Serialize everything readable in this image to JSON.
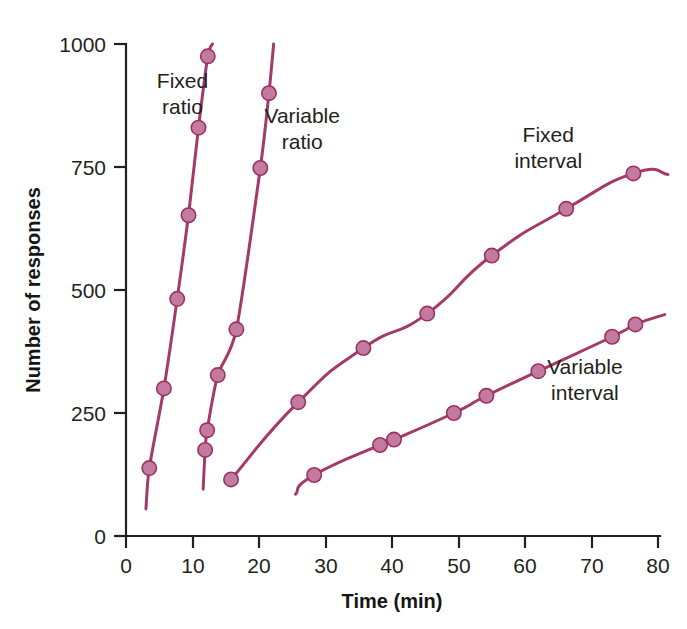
{
  "chart_data": {
    "type": "line",
    "title": "",
    "xlabel": "Time (min)",
    "ylabel": "Number of responses",
    "xlim": [
      0,
      83
    ],
    "ylim": [
      0,
      1010
    ],
    "xticks": [
      0,
      10,
      20,
      30,
      40,
      50,
      60,
      70,
      80
    ],
    "yticks": [
      0,
      250,
      500,
      750,
      1000
    ],
    "grid": false,
    "legend_position": "inline-annotations",
    "colors": {
      "line": "#A33A68",
      "marker_fill": "#C27A9E",
      "marker_stroke": "#9E3163",
      "axis": "#231f20",
      "background": "#FFFFFF"
    },
    "series": [
      {
        "name": "Fixed ratio",
        "label": "Fixed ratio",
        "label_line1": "Fixed",
        "label_line2": "ratio",
        "points": [
          {
            "x": 3.5,
            "y": 138
          },
          {
            "x": 5.7,
            "y": 300
          },
          {
            "x": 7.7,
            "y": 482
          },
          {
            "x": 9.4,
            "y": 652
          },
          {
            "x": 10.9,
            "y": 830
          },
          {
            "x": 12.3,
            "y": 975
          }
        ],
        "start": {
          "x": 3.0,
          "y": 55
        },
        "end": {
          "x": 13.0,
          "y": 1000
        }
      },
      {
        "name": "Variable ratio",
        "label": "Variable ratio",
        "label_line1": "Variable",
        "label_line2": "ratio",
        "points": [
          {
            "x": 11.9,
            "y": 175
          },
          {
            "x": 12.2,
            "y": 215
          },
          {
            "x": 13.8,
            "y": 327
          },
          {
            "x": 16.6,
            "y": 420
          },
          {
            "x": 20.2,
            "y": 748
          },
          {
            "x": 21.5,
            "y": 900
          }
        ],
        "start": {
          "x": 11.6,
          "y": 95
        },
        "end": {
          "x": 22.2,
          "y": 1000
        }
      },
      {
        "name": "Fixed interval",
        "label": "Fixed interval",
        "label_line1": "Fixed",
        "label_line2": "interval",
        "points": [
          {
            "x": 15.8,
            "y": 115
          },
          {
            "x": 25.9,
            "y": 272
          },
          {
            "x": 35.7,
            "y": 382
          },
          {
            "x": 45.3,
            "y": 452
          },
          {
            "x": 55.0,
            "y": 570
          },
          {
            "x": 66.2,
            "y": 665
          },
          {
            "x": 76.3,
            "y": 737
          }
        ],
        "end": {
          "x": 81.5,
          "y": 735
        }
      },
      {
        "name": "Variable interval",
        "label": "Variable interval",
        "label_line1": "Variable",
        "label_line2": "interval",
        "points": [
          {
            "x": 28.3,
            "y": 124
          },
          {
            "x": 38.2,
            "y": 185
          },
          {
            "x": 40.3,
            "y": 196
          },
          {
            "x": 49.3,
            "y": 250
          },
          {
            "x": 54.2,
            "y": 285
          },
          {
            "x": 62.0,
            "y": 335
          },
          {
            "x": 73.1,
            "y": 405
          },
          {
            "x": 76.6,
            "y": 430
          }
        ],
        "start": {
          "x": 25.5,
          "y": 85
        },
        "end": {
          "x": 81.0,
          "y": 450
        }
      }
    ],
    "annotations": [
      {
        "text_line1": "Fixed",
        "text_line2": "ratio",
        "x": 8.5,
        "y": 910
      },
      {
        "text_line1": "Variable",
        "text_line2": "ratio",
        "x": 26.5,
        "y": 840
      },
      {
        "text_line1": "Fixed",
        "text_line2": "interval",
        "x": 63.5,
        "y": 800
      },
      {
        "text_line1": "Variable",
        "text_line2": "interval",
        "x": 69.0,
        "y": 330
      }
    ]
  }
}
